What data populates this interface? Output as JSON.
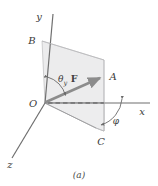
{
  "figure": {
    "caption": "(a)",
    "background_color": "#ffffff",
    "axis_color": "#6f6f6f",
    "plane_fill_color": "#ececed",
    "plane_edge_color": "#b9b9bb",
    "vector_color": "#8c8c8c",
    "label_color": "#3a3a3a",
    "dashed_color": "#555555"
  },
  "axes": [
    {
      "name": "y-axis",
      "label": "y",
      "direction": "up"
    },
    {
      "name": "x-axis",
      "label": "x",
      "direction": "right"
    },
    {
      "name": "z-axis",
      "label": "z",
      "direction": "down-left"
    }
  ],
  "points": [
    {
      "name": "origin",
      "label": "O"
    },
    {
      "name": "point-b",
      "label": "B"
    },
    {
      "name": "point-a",
      "label": "A"
    },
    {
      "name": "point-c",
      "label": "C"
    }
  ],
  "vector": {
    "label": "F",
    "from": "O",
    "to": "A"
  },
  "angles": [
    {
      "name": "theta-y",
      "symbol": "θ",
      "subscript": "y"
    },
    {
      "name": "phi",
      "symbol": "φ",
      "subscript": ""
    }
  ]
}
